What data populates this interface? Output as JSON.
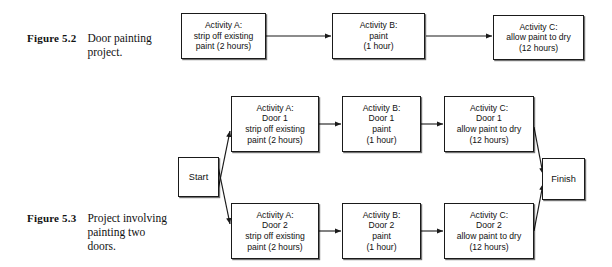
{
  "figures": [
    {
      "id": "figure-5-2",
      "label": "Figure 5.2",
      "text": "Door painting\nproject.",
      "nodes": [
        {
          "id": "f52-activity-a",
          "text": "Activity A:\nstrip off existing\npaint (2 hours)"
        },
        {
          "id": "f52-activity-b",
          "text": "Activity B:\npaint\n(1 hour)"
        },
        {
          "id": "f52-activity-c",
          "text": "Activity C:\nallow paint to dry\n(12 hours)"
        }
      ]
    },
    {
      "id": "figure-5-3",
      "label": "Figure 5.3",
      "text": "Project involving\npainting two\ndoors.",
      "nodes": [
        {
          "id": "f53-start",
          "text": "Start"
        },
        {
          "id": "f53-door1-activity-a",
          "text": "Activity A:\nDoor 1\nstrip off existing\npaint (2 hours)"
        },
        {
          "id": "f53-door1-activity-b",
          "text": "Activity B:\nDoor 1\npaint\n(1 hour)"
        },
        {
          "id": "f53-door1-activity-c",
          "text": "Activity C:\nDoor 1\nallow paint to dry\n(12 hours)"
        },
        {
          "id": "f53-door2-activity-a",
          "text": "Activity A:\nDoor 2\nstrip off existing\npaint (2 hours)"
        },
        {
          "id": "f53-door2-activity-b",
          "text": "Activity B:\nDoor 2\npaint\n(1 hour)"
        },
        {
          "id": "f53-door2-activity-c",
          "text": "Activity C:\nDoor 2\nallow paint to dry\n(12 hours)"
        },
        {
          "id": "f53-finish",
          "text": "Finish"
        }
      ]
    }
  ],
  "colors": {
    "ink": "#111111",
    "line": "#1a1a1a",
    "background": "#ffffff"
  }
}
